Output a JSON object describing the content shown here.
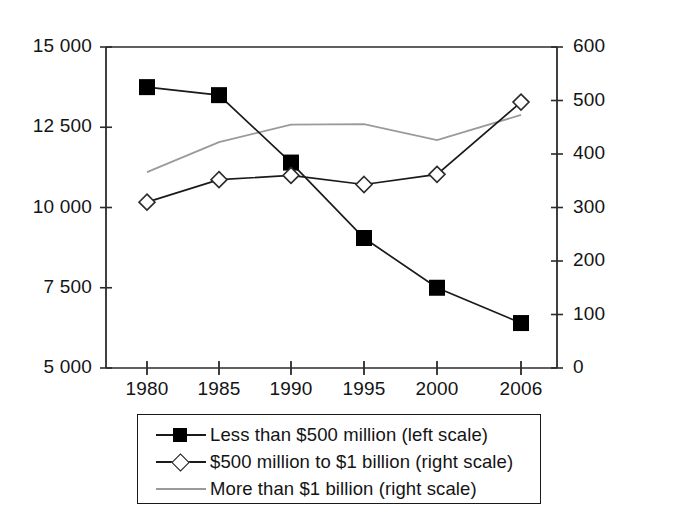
{
  "chart_data": {
    "type": "line",
    "title": "",
    "subtitle": "",
    "xlabel": "",
    "ylabel": "",
    "categories": [
      "1980",
      "1985",
      "1990",
      "1995",
      "2000",
      "2006"
    ],
    "x_tick_labels": [
      "1980",
      "1985",
      "1990",
      "1995",
      "2000",
      "2006"
    ],
    "grid": false,
    "legend_position": "bottom",
    "axes": {
      "left": {
        "label": "",
        "ylim": [
          5000,
          15000
        ],
        "ticks": [
          5000,
          7500,
          10000,
          12500,
          15000
        ],
        "tick_labels": [
          "5 000",
          "7 500",
          "10 000",
          "12 500",
          "15 000"
        ]
      },
      "right": {
        "label": "",
        "ylim": [
          0,
          600
        ],
        "ticks": [
          0,
          100,
          200,
          300,
          400,
          500,
          600
        ],
        "tick_labels": [
          "0",
          "100",
          "200",
          "300",
          "400",
          "500",
          "600"
        ]
      }
    },
    "series": [
      {
        "name": "Less than $500 million (left scale)",
        "axis": "left",
        "color": "#1a1a1a",
        "marker": "filled-square",
        "values": [
          13750,
          13500,
          11400,
          9050,
          7500,
          6400
        ]
      },
      {
        "name": "$500 million to $1 billion (right scale)",
        "axis": "right",
        "color": "#1a1a1a",
        "marker": "open-diamond",
        "values": [
          310,
          352,
          360,
          343,
          362,
          497
        ]
      },
      {
        "name": "More than $1 billion (right scale)",
        "axis": "right",
        "color": "#9a9a9a",
        "marker": "none",
        "values": [
          366,
          422,
          455,
          456,
          426,
          473
        ]
      }
    ]
  },
  "legend": {
    "items": [
      {
        "label": "Less than $500 million (left scale)",
        "symbol": "filled-square-line",
        "color": "#1a1a1a"
      },
      {
        "label": "$500 million to $1 billion (right scale)",
        "symbol": "open-diamond-line",
        "color": "#1a1a1a"
      },
      {
        "label": "More than $1 billion (right scale)",
        "symbol": "plain-gray-line",
        "color": "#9a9a9a"
      }
    ]
  }
}
